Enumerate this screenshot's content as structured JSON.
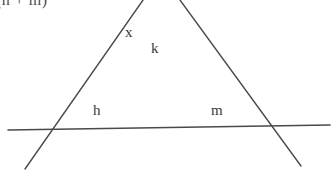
{
  "figure": {
    "kind": "geometry-diagram",
    "width": 335,
    "height": 172,
    "background_color": "#ffffff",
    "stroke_color": "#4a4a4a",
    "stroke_width": 1.4,
    "clipped_expression": "(h + m)",
    "labels": {
      "x": "x",
      "k": "k",
      "h": "h",
      "m": "m"
    },
    "label_color": "#3a3a3a",
    "lines": [
      {
        "name": "transversal-left",
        "description": "line running from upper-right apex down to lower-left",
        "x1": 143,
        "y1": 0,
        "x2": 25,
        "y2": 169
      },
      {
        "name": "transversal-right",
        "description": "line running from upper-left apex down to lower-right",
        "x1": 180,
        "y1": 0,
        "x2": 301,
        "y2": 166
      },
      {
        "name": "horizontal-base-line",
        "description": "near-horizontal line crossing both transversals",
        "x1": 8,
        "y1": 130,
        "x2": 330,
        "y2": 125
      }
    ],
    "intersections": [
      {
        "name": "apex-vertex",
        "x": 158,
        "y": 24
      },
      {
        "name": "left-base-vertex",
        "x": 58,
        "y": 129
      },
      {
        "name": "right-base-vertex",
        "x": 258,
        "y": 127
      }
    ]
  }
}
